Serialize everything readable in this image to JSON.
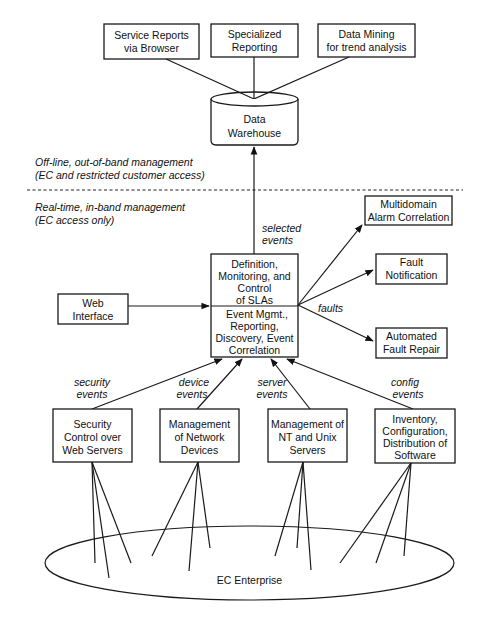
{
  "diagram": {
    "top_boxes": [
      {
        "line1": "Service Reports",
        "line2": "via Browser"
      },
      {
        "line1": "Specialized",
        "line2": "Reporting"
      },
      {
        "line1": "Data Mining",
        "line2": "for trend analysis"
      }
    ],
    "warehouse": {
      "line1": "Data",
      "line2": "Warehouse"
    },
    "zones": {
      "offline": {
        "line1": "Off-line, out-of-band management",
        "line2": "(EC and restricted customer access)"
      },
      "realtime": {
        "line1": "Real-time, in-band management",
        "line2": "(EC access only)"
      }
    },
    "selected_events": {
      "line1": "selected",
      "line2": "events"
    },
    "central_box": {
      "top": [
        "Definition,",
        "Monitoring, and",
        "Control",
        "of SLAs"
      ],
      "bottom": [
        "Event Mgmt.,",
        "Reporting,",
        "Discovery, Event",
        "Correlation"
      ]
    },
    "web_interface": {
      "line1": "Web",
      "line2": "Interface"
    },
    "fault_outputs": {
      "label": "faults",
      "multidomain": {
        "line1": "Multidomain",
        "line2": "Alarm Correlation"
      },
      "notification": {
        "line1": "Fault",
        "line2": "Notification"
      },
      "repair": {
        "line1": "Automated",
        "line2": "Fault Repair"
      }
    },
    "event_labels": [
      {
        "line1": "security",
        "line2": "events"
      },
      {
        "line1": "device",
        "line2": "events"
      },
      {
        "line1": "server",
        "line2": "events"
      },
      {
        "line1": "config",
        "line2": "events"
      }
    ],
    "source_boxes": [
      {
        "lines": [
          "Security",
          "Control over",
          "Web Servers"
        ]
      },
      {
        "lines": [
          "Management",
          "of Network",
          "Devices"
        ]
      },
      {
        "lines": [
          "Management of",
          "NT and Unix",
          "Servers"
        ]
      },
      {
        "lines": [
          "Inventory,",
          "Configuration,",
          "Distribution of",
          "Software"
        ]
      }
    ],
    "enterprise": {
      "label": "EC Enterprise"
    }
  }
}
